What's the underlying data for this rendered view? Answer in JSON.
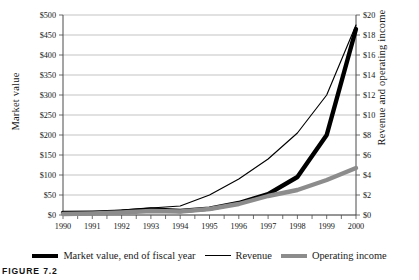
{
  "figure": {
    "caption": "FIGURE 7.2"
  },
  "legend": {
    "items": [
      {
        "label": "Market value, end of fiscal year",
        "swatch": "thick-black-line-icon"
      },
      {
        "label": "Revenue",
        "swatch": "thin-black-line-icon"
      },
      {
        "label": "Operating income",
        "swatch": "thick-gray-line-icon"
      }
    ]
  },
  "chart_data": {
    "type": "line",
    "title": "",
    "xlabel": "",
    "ylabel": "Market value",
    "y2label": "Revenue and operating income",
    "grid": true,
    "legend_position": "bottom",
    "categories": [
      "1990",
      "1991",
      "1992",
      "1993",
      "1994",
      "1995",
      "1996",
      "1997",
      "1998",
      "1999",
      "2000"
    ],
    "x_tick_labels": [
      "1990",
      "1991",
      "1992",
      "1993",
      "1994",
      "1995",
      "1996",
      "1997",
      "1998",
      "1999",
      "2000"
    ],
    "ylim": [
      0,
      500
    ],
    "y_tick_labels": [
      "$0",
      "$50",
      "$100",
      "$150",
      "$200",
      "$250",
      "$300",
      "$350",
      "$400",
      "$450",
      "$500"
    ],
    "y_tick_values": [
      0,
      50,
      100,
      150,
      200,
      250,
      300,
      350,
      400,
      450,
      500
    ],
    "y2lim": [
      0,
      20
    ],
    "y2_tick_labels": [
      "$0",
      "$2",
      "$4",
      "$6",
      "$8",
      "$10",
      "$12",
      "$14",
      "$16",
      "$18",
      "$20"
    ],
    "y2_tick_values": [
      0,
      2,
      4,
      6,
      8,
      10,
      12,
      14,
      16,
      18,
      20
    ],
    "series": [
      {
        "name": "Market value, end of fiscal year",
        "axis": "left",
        "color": "#000000",
        "width": "thick",
        "values": [
          5,
          6,
          8,
          14,
          10,
          16,
          30,
          52,
          95,
          200,
          465
        ]
      },
      {
        "name": "Revenue",
        "axis": "right",
        "color": "#000000",
        "width": "thin",
        "values": [
          0.2,
          0.3,
          0.5,
          0.7,
          0.9,
          2.0,
          3.6,
          5.6,
          8.2,
          12.0,
          19.0
        ]
      },
      {
        "name": "Operating income",
        "axis": "right",
        "color": "#8c8c8c",
        "width": "thick",
        "values": [
          0.1,
          0.15,
          0.25,
          0.4,
          0.35,
          0.6,
          1.1,
          1.9,
          2.5,
          3.5,
          4.7
        ]
      }
    ]
  }
}
